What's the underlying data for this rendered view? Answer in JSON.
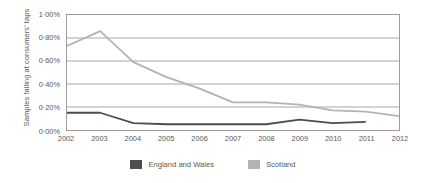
{
  "chart_data": {
    "type": "line",
    "title": "",
    "xlabel": "",
    "ylabel": "Samples failing at consumers' taps",
    "categories": [
      "2002",
      "2003",
      "2004",
      "2005",
      "2006",
      "2007",
      "2008",
      "2009",
      "2010",
      "2011",
      "2012"
    ],
    "x": [
      2002,
      2003,
      2004,
      2005,
      2006,
      2007,
      2008,
      2009,
      2010,
      2011,
      2012
    ],
    "ylim": [
      0,
      1.0
    ],
    "ytick_values": [
      0.0,
      0.2,
      0.4,
      0.6,
      0.8,
      1.0
    ],
    "ytick_labels": [
      "0·00%",
      "0·20%",
      "0·40%",
      "0·60%",
      "0·80%",
      "1·00%"
    ],
    "grid": "horizontal",
    "legend_position": "bottom",
    "series": [
      {
        "name": "England and Wales",
        "color": "#4d4d4d",
        "values": [
          0.15,
          0.15,
          0.06,
          0.05,
          0.05,
          0.05,
          0.05,
          0.09,
          0.06,
          0.07,
          null
        ]
      },
      {
        "name": "Scotland",
        "color": "#b3b3b3",
        "values": [
          0.73,
          0.86,
          0.59,
          0.46,
          0.36,
          0.24,
          0.24,
          0.22,
          0.17,
          0.16,
          0.12
        ]
      }
    ]
  },
  "axis": {
    "ylabel_text": "Samples failing at consumers' taps",
    "ytick_labels": [
      "1·00%",
      "0·80%",
      "0·60%",
      "0·40%",
      "0·20%",
      "0·00%"
    ],
    "xtick_labels": [
      "2002",
      "2003",
      "2004",
      "2005",
      "2006",
      "2007",
      "2008",
      "2009",
      "2010",
      "2011",
      "2012"
    ]
  },
  "legend": {
    "items": [
      {
        "label": "England and Wales",
        "color": "#4d4d4d"
      },
      {
        "label": "Scotland",
        "color": "#b3b3b3"
      }
    ]
  },
  "style": {
    "grid_color": "#9d9d9d",
    "frame_color": "#9d9d9d",
    "text_color": "#58595b",
    "background": "#ffffff"
  }
}
